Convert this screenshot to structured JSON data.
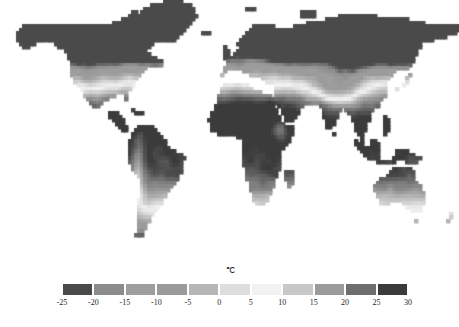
{
  "figure": {
    "panel_label": "(c)",
    "background_color": "#ffffff"
  },
  "colorbar": {
    "unit_label": "℃",
    "tick_labels": [
      "-25",
      "-20",
      "-15",
      "-10",
      "-5",
      "0",
      "5",
      "10",
      "15",
      "20",
      "25",
      "30"
    ],
    "tick_values": [
      -25,
      -20,
      -15,
      -10,
      -5,
      0,
      5,
      10,
      15,
      20,
      25,
      30
    ],
    "segment_count": 11,
    "segment_ranges": [
      "-25 to -20",
      "-20 to -15",
      "-15 to -10",
      "-10 to -5",
      "-5 to 0",
      "0 to 5",
      "5 to 10",
      "10 to 15",
      "15 to 20",
      "20 to 25",
      "25 to 30"
    ],
    "segment_colors": [
      "#4a4a4a",
      "#8c8c8c",
      "#9e9e9e",
      "#9a9a9a",
      "#b6b6b6",
      "#dedede",
      "#f2f2f2",
      "#c8c8c8",
      "#9b9b9b",
      "#6e6e6e",
      "#3b3b3b"
    ],
    "segment_edge_color": "#ffffff"
  },
  "chart_data": {
    "type": "heatmap",
    "title": "(c)",
    "subtitle": "",
    "xlabel": "",
    "ylabel": "",
    "colorbar_label": "℃",
    "colorbar_orientation": "horizontal",
    "colorbar_position": "bottom",
    "grid": false,
    "projection": "equirectangular",
    "lon_range": [
      -180,
      180
    ],
    "lat_range": [
      -60,
      84
    ],
    "value_range": [
      -25,
      30
    ],
    "value_unit": "degrees Celsius",
    "variable": "mean annual near-surface air temperature",
    "colormap": "grayscale-diverging (dark at cold extreme, light near 5-10 C, dark at warm extreme)",
    "ocean_color": "#ffffff",
    "legend_position": "bottom-center",
    "region_values": [
      {
        "region": "Arctic Canada / Greenland",
        "value": -22
      },
      {
        "region": "Northern Siberia",
        "value": -16
      },
      {
        "region": "Alaska",
        "value": -8
      },
      {
        "region": "Scandinavia",
        "value": -2
      },
      {
        "region": "Central Europe",
        "value": 8
      },
      {
        "region": "Central Asia",
        "value": 5
      },
      {
        "region": "Tibetan Plateau",
        "value": -4
      },
      {
        "region": "Eastern United States",
        "value": 10
      },
      {
        "region": "Mexico",
        "value": 21
      },
      {
        "region": "Amazon Basin",
        "value": 27
      },
      {
        "region": "Southern South America",
        "value": 9
      },
      {
        "region": "Sahara / North Africa",
        "value": 28
      },
      {
        "region": "Central Africa",
        "value": 26
      },
      {
        "region": "Southern Africa",
        "value": 20
      },
      {
        "region": "Arabian Peninsula",
        "value": 28
      },
      {
        "region": "India",
        "value": 26
      },
      {
        "region": "Southeast Asia",
        "value": 27
      },
      {
        "region": "Eastern China",
        "value": 14
      },
      {
        "region": "Japan",
        "value": 12
      },
      {
        "region": "Australia interior",
        "value": 24
      },
      {
        "region": "Southern Australia",
        "value": 16
      },
      {
        "region": "New Zealand",
        "value": 11
      }
    ]
  },
  "map_grid": {
    "cols": 144,
    "rows": 72,
    "nodata_value": null,
    "note": "Values are mean annual temperature in degrees Celsius; null marks ocean / no-data cells rendered white."
  }
}
